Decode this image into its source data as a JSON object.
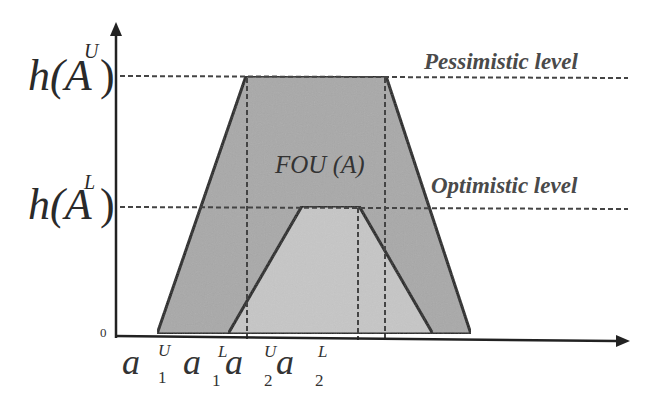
{
  "diagram": {
    "colors": {
      "umf_fill": "#a9a9a9",
      "lmf_fill": "#c4c4c4",
      "stroke": "#222222",
      "dashed": "#444444",
      "label": "#4a4a4a"
    },
    "y_axis": {
      "zero_label": "0",
      "ticks": [
        {
          "base": "h(A",
          "sup": "U",
          "close": ")",
          "name": "h(A^U)"
        },
        {
          "base": "h(A",
          "sup": "L",
          "close": ")",
          "name": "h(A^L)"
        }
      ]
    },
    "x_axis": {
      "labels": [
        {
          "base": "a",
          "sub": "1",
          "sup": "U",
          "name": "a1U"
        },
        {
          "base": "a",
          "sub": "1",
          "sup": "L",
          "name": "a1L"
        },
        {
          "base": "a",
          "sub": "2",
          "sup": "U",
          "name": "a2U"
        },
        {
          "base": "a",
          "sub": "2",
          "sup": "L",
          "name": "a2L"
        }
      ]
    },
    "annotations": {
      "fou": "FOU (A)",
      "pessimistic": "Pessimistic level",
      "optimistic": "Optimistic level"
    },
    "shapes": {
      "upper_membership": {
        "points": [
          [
            157,
            334
          ],
          [
            246,
            76
          ],
          [
            386,
            76
          ],
          [
            471,
            334
          ]
        ]
      },
      "lower_membership": {
        "points": [
          [
            228,
            334
          ],
          [
            302,
            206
          ],
          [
            359,
            206
          ],
          [
            433,
            334
          ]
        ]
      }
    }
  }
}
